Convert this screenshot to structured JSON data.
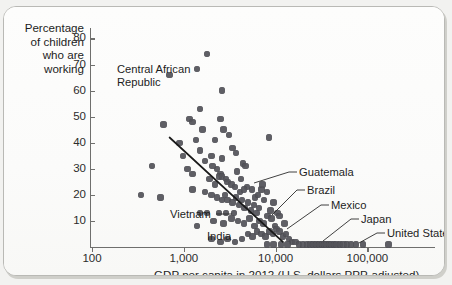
{
  "chart_data": {
    "type": "scatter",
    "title": "",
    "xlabel": "GDP per capita in 2012 (U.S. dollars PPP-adjusted)",
    "ylabel": "Percentage of children who are working",
    "xscale": "log",
    "xlim": [
      100,
      200000
    ],
    "ylim": [
      0,
      84
    ],
    "xticks": [
      100,
      1000,
      10000,
      100000
    ],
    "xtick_labels": [
      "100",
      "1,000",
      "10,000",
      "100,000"
    ],
    "yticks": [
      10,
      20,
      30,
      40,
      50,
      60,
      70,
      80
    ],
    "ytick_labels": [
      "10",
      "20",
      "30",
      "40",
      "50",
      "60",
      "70",
      "80"
    ],
    "grid": false,
    "legend": "none",
    "marker_color": "#54545a",
    "trendline": {
      "label": "fitted trend",
      "x_start": 700,
      "y_start": 42,
      "x_end": 12000,
      "y_end": 2,
      "color": "#1a1a1a"
    },
    "annotations": [
      {
        "label": "Central African Republic",
        "x": 700,
        "y": 66
      },
      {
        "label": "Guatemala",
        "x": 6500,
        "y": 25
      },
      {
        "label": "Brazil",
        "x": 11000,
        "y": 15
      },
      {
        "label": "Mexico",
        "x": 16000,
        "y": 6
      },
      {
        "label": "Japan",
        "x": 36000,
        "y": 1
      },
      {
        "label": "United States",
        "x": 52000,
        "y": 1
      },
      {
        "label": "Vietnam",
        "x": 3500,
        "y": 13
      },
      {
        "label": "India",
        "x": 5000,
        "y": 1
      }
    ],
    "points": [
      [
        1800,
        74
      ],
      [
        700,
        66
      ],
      [
        2600,
        60
      ],
      [
        1500,
        53
      ],
      [
        1150,
        49
      ],
      [
        1250,
        48
      ],
      [
        600,
        47
      ],
      [
        2500,
        49
      ],
      [
        2700,
        45
      ],
      [
        3100,
        43
      ],
      [
        900,
        40
      ],
      [
        2200,
        41
      ],
      [
        1500,
        37
      ],
      [
        2000,
        35
      ],
      [
        2600,
        34
      ],
      [
        1700,
        33
      ],
      [
        8500,
        42
      ],
      [
        450,
        31
      ],
      [
        3400,
        38
      ],
      [
        3700,
        36
      ],
      [
        2300,
        30
      ],
      [
        2500,
        28
      ],
      [
        2400,
        27
      ],
      [
        2600,
        27
      ],
      [
        2900,
        26
      ],
      [
        3000,
        25
      ],
      [
        4400,
        32
      ],
      [
        4700,
        31
      ],
      [
        3300,
        24
      ],
      [
        3600,
        23
      ],
      [
        4200,
        26
      ],
      [
        1250,
        28
      ],
      [
        340,
        20
      ],
      [
        560,
        19
      ],
      [
        1700,
        21
      ],
      [
        2000,
        20
      ],
      [
        2300,
        19
      ],
      [
        2600,
        18
      ],
      [
        2800,
        20
      ],
      [
        3000,
        18
      ],
      [
        3400,
        17
      ],
      [
        3700,
        19
      ],
      [
        4000,
        16
      ],
      [
        4300,
        18
      ],
      [
        4600,
        15
      ],
      [
        5000,
        17
      ],
      [
        5400,
        14
      ],
      [
        5800,
        16
      ],
      [
        6200,
        13
      ],
      [
        6600,
        15
      ],
      [
        1500,
        13
      ],
      [
        1800,
        13
      ],
      [
        2400,
        13
      ],
      [
        2900,
        13
      ],
      [
        3500,
        13
      ],
      [
        1400,
        8
      ],
      [
        2100,
        10
      ],
      [
        2700,
        9
      ],
      [
        3300,
        11
      ],
      [
        3900,
        10
      ],
      [
        4500,
        9
      ],
      [
        5200,
        11
      ],
      [
        5900,
        8
      ],
      [
        6700,
        10
      ],
      [
        7400,
        9
      ],
      [
        8200,
        12
      ],
      [
        9000,
        11
      ],
      [
        9800,
        8
      ],
      [
        5000,
        5
      ],
      [
        5600,
        4
      ],
      [
        6300,
        6
      ],
      [
        7000,
        5
      ],
      [
        7800,
        4
      ],
      [
        8600,
        6
      ],
      [
        9400,
        5
      ],
      [
        10200,
        7
      ],
      [
        11000,
        6
      ],
      [
        12000,
        4
      ],
      [
        13000,
        5
      ],
      [
        14000,
        3
      ],
      [
        2000,
        3
      ],
      [
        2500,
        2
      ],
      [
        3000,
        3
      ],
      [
        3600,
        2
      ],
      [
        4300,
        3
      ],
      [
        15000,
        2
      ],
      [
        16500,
        2
      ],
      [
        18000,
        1
      ],
      [
        20000,
        1
      ],
      [
        22000,
        1
      ],
      [
        24000,
        1
      ],
      [
        26000,
        1
      ],
      [
        28000,
        1
      ],
      [
        30000,
        1
      ],
      [
        32000,
        1
      ],
      [
        34000,
        1
      ],
      [
        36000,
        1
      ],
      [
        38000,
        1
      ],
      [
        40000,
        1
      ],
      [
        43000,
        1
      ],
      [
        46000,
        1
      ],
      [
        50000,
        1
      ],
      [
        55000,
        1
      ],
      [
        60000,
        1
      ],
      [
        66000,
        1
      ],
      [
        75000,
        1
      ],
      [
        90000,
        1
      ],
      [
        8000,
        1
      ],
      [
        9500,
        1
      ],
      [
        11500,
        1
      ],
      [
        13500,
        1
      ],
      [
        6000,
        19
      ],
      [
        7500,
        18
      ],
      [
        8800,
        14
      ],
      [
        10500,
        13
      ],
      [
        7000,
        22
      ],
      [
        8000,
        21
      ],
      [
        9500,
        17
      ],
      [
        11000,
        12
      ],
      [
        12500,
        9
      ],
      [
        5500,
        22
      ],
      [
        6400,
        20
      ],
      [
        7200,
        24
      ],
      [
        4900,
        23
      ],
      [
        4100,
        21
      ],
      [
        3800,
        29
      ],
      [
        4500,
        22
      ],
      [
        2200,
        24
      ],
      [
        1900,
        26
      ],
      [
        2050,
        31
      ],
      [
        1600,
        45
      ],
      [
        1350,
        41
      ],
      [
        980,
        35
      ],
      [
        1100,
        30
      ],
      [
        1250,
        22
      ],
      [
        170000,
        1
      ]
    ]
  }
}
